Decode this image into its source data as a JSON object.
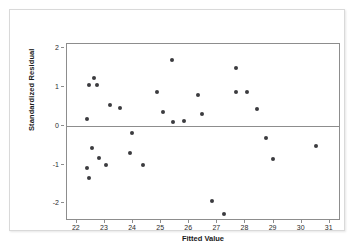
{
  "chart_data": {
    "type": "scatter",
    "title": "",
    "xlabel": "Fitted Value",
    "ylabel": "Standardized Residual",
    "xlim": [
      21.65,
      31.4
    ],
    "ylim": [
      -2.45,
      2.1
    ],
    "xticks": [
      22,
      23,
      24,
      25,
      26,
      27,
      28,
      29,
      30,
      31
    ],
    "yticks": [
      2,
      1,
      0,
      -1,
      -2
    ],
    "xtick_labels": [
      "22",
      "23",
      "24",
      "25",
      "26",
      "27",
      "28",
      "29",
      "30",
      "31"
    ],
    "ytick_labels": [
      "2",
      "1",
      "0",
      "-1",
      "-2"
    ],
    "grid": false,
    "legend": null,
    "reference_lines": [
      {
        "name": "zero-line",
        "orientation": "horizontal",
        "y": 0,
        "color": "#8d8d8d"
      }
    ],
    "marker": {
      "shape": "circle",
      "color": "#3b3b3f",
      "size": 4
    },
    "points": [
      {
        "x": 22.35,
        "y": 0.18
      },
      {
        "x": 22.42,
        "y": 1.05
      },
      {
        "x": 22.62,
        "y": 1.22
      },
      {
        "x": 22.72,
        "y": 1.04
      },
      {
        "x": 22.35,
        "y": -1.1
      },
      {
        "x": 22.42,
        "y": -1.35
      },
      {
        "x": 22.55,
        "y": -0.57
      },
      {
        "x": 22.78,
        "y": -0.83
      },
      {
        "x": 23.05,
        "y": -1.0
      },
      {
        "x": 23.18,
        "y": 0.53
      },
      {
        "x": 23.52,
        "y": 0.46
      },
      {
        "x": 23.88,
        "y": -0.69
      },
      {
        "x": 23.95,
        "y": -0.19
      },
      {
        "x": 24.35,
        "y": -1.02
      },
      {
        "x": 24.85,
        "y": 0.87
      },
      {
        "x": 25.08,
        "y": 0.34
      },
      {
        "x": 25.4,
        "y": 1.7
      },
      {
        "x": 25.42,
        "y": 0.09
      },
      {
        "x": 25.8,
        "y": 0.11
      },
      {
        "x": 26.32,
        "y": 0.79
      },
      {
        "x": 26.45,
        "y": 0.29
      },
      {
        "x": 26.8,
        "y": -1.93
      },
      {
        "x": 27.22,
        "y": -2.28
      },
      {
        "x": 27.65,
        "y": 1.49
      },
      {
        "x": 27.68,
        "y": 0.87
      },
      {
        "x": 28.05,
        "y": 0.86
      },
      {
        "x": 28.42,
        "y": 0.42
      },
      {
        "x": 28.72,
        "y": -0.32
      },
      {
        "x": 28.98,
        "y": -0.86
      },
      {
        "x": 30.52,
        "y": -0.52
      }
    ]
  }
}
